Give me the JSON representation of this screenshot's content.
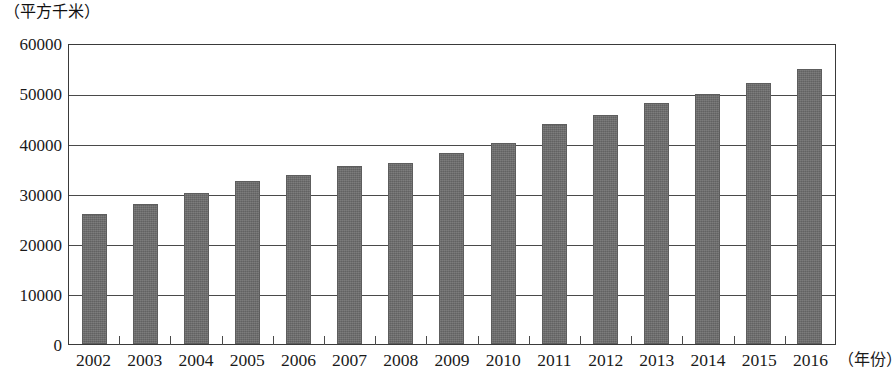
{
  "chart_data": {
    "type": "bar",
    "title": "",
    "subtitle": "",
    "xlabel": "（年份）",
    "ylabel": "（平方千米）",
    "categories": [
      "2002",
      "2003",
      "2004",
      "2005",
      "2006",
      "2007",
      "2008",
      "2009",
      "2010",
      "2011",
      "2012",
      "2013",
      "2014",
      "2015",
      "2016"
    ],
    "values": [
      26000,
      28000,
      30200,
      32400,
      33600,
      35500,
      36000,
      38000,
      40000,
      43800,
      45700,
      48000,
      49800,
      52000,
      54800
    ],
    "series": [
      {
        "name": "城市建成区面积",
        "values": [
          26000,
          28000,
          30200,
          32400,
          33600,
          35500,
          36000,
          38000,
          40000,
          43800,
          45700,
          48000,
          49800,
          52000,
          54800
        ]
      }
    ],
    "ylim": [
      0,
      60000
    ],
    "ytick_values": [
      0,
      10000,
      20000,
      30000,
      40000,
      50000,
      60000
    ],
    "ytick_labels": [
      "0",
      "10000",
      "20000",
      "30000",
      "40000",
      "50000",
      "60000"
    ],
    "grid": true,
    "grid_axis": "y",
    "legend": false,
    "legend_position": "none",
    "bar_color": "#6b6b6b",
    "axis_color": "#3a3a3a",
    "background_color": "#ffffff"
  }
}
